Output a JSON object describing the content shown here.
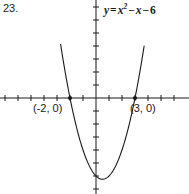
{
  "figure": {
    "problem_number": "23.",
    "background_color": "#ffffff",
    "line_color": "#1a1a1a"
  },
  "equation": {
    "lhs": "y",
    "equals": "=",
    "var": "x",
    "exponent": "2",
    "minus_1": "−",
    "term_2": "x",
    "minus_2": "−",
    "constant": "6",
    "full_text": "y = x² − x − 6"
  },
  "labels": {
    "intercept_left": "(-2, 0)",
    "intercept_right": "(3, 0)"
  },
  "chart_data": {
    "type": "line",
    "title": "",
    "subtitle": "",
    "xlabel": "",
    "ylabel": "",
    "function": "y = x^2 - x - 6",
    "coefficients": {
      "a": 1,
      "b": -1,
      "c": -6
    },
    "vertex": {
      "x": 0.5,
      "y": -6.25
    },
    "roots": [
      -2,
      3
    ],
    "annotations": [
      {
        "label": "(-2, 0)",
        "x": -2,
        "y": 0,
        "marker": "dot"
      },
      {
        "label": "(3, 0)",
        "x": 3,
        "y": 0,
        "marker": "dot"
      },
      {
        "label": "y = x² − x − 6",
        "x": 4.0,
        "y": 8.0,
        "marker": "none"
      }
    ],
    "xlim": [
      -7.4,
      7.2
    ],
    "ylim": [
      -8.6,
      7.5
    ],
    "tick_step_x": 1,
    "tick_step_y": 1,
    "grid": false,
    "legend": "none",
    "axes": "crossed-at-origin",
    "x": [
      -2.6,
      -2.4,
      -2.2,
      -2.0,
      -1.8,
      -1.6,
      -1.4,
      -1.2,
      -1.0,
      -0.8,
      -0.6,
      -0.4,
      -0.2,
      0.0,
      0.2,
      0.4,
      0.6,
      0.8,
      1.0,
      1.2,
      1.4,
      1.6,
      1.8,
      2.0,
      2.2,
      2.4,
      2.6,
      2.8,
      3.0,
      3.2,
      3.4,
      3.6
    ],
    "y": [
      3.36,
      2.16,
      1.04,
      0.0,
      -0.96,
      -1.84,
      -2.64,
      -3.36,
      -4.0,
      -4.56,
      -5.04,
      -5.44,
      -5.76,
      -6.0,
      -6.16,
      -6.24,
      -6.24,
      -6.16,
      -6.0,
      -5.76,
      -5.44,
      -5.04,
      -4.56,
      -4.0,
      -3.36,
      -2.64,
      -1.84,
      -0.96,
      0.0,
      1.04,
      2.16,
      3.36
    ]
  }
}
